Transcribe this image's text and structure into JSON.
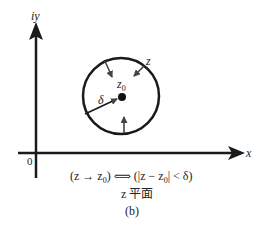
{
  "figure": {
    "axis_labels": {
      "y": "iy",
      "x": "x",
      "origin": "0"
    },
    "circle_labels": {
      "center": "z",
      "center_sub": "0",
      "point": "z",
      "radius": "δ"
    },
    "caption": {
      "line1_a": "(z → z",
      "line1_a_sub": "0",
      "line1_b": ") ⟺ (|z − z",
      "line1_b_sub": "0",
      "line1_c": "| < δ)",
      "line2": "z 平面",
      "line3": "(b)"
    },
    "colors": {
      "stroke": "#1a1a1a",
      "text": "#222222",
      "background": "#ffffff"
    }
  }
}
